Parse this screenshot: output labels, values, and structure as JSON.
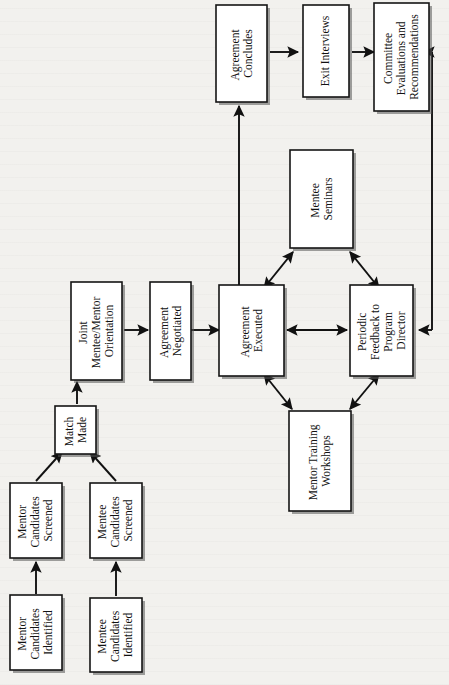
{
  "diagram": {
    "orientation": "rotated-90-ccw",
    "page_background": "#f2f1ee",
    "line_color": "#111111",
    "box_fill": "#ffffff",
    "nodes": [
      {
        "id": "mentor-candidates-identified",
        "lines": [
          "Mentor",
          "Candidates",
          "Identified"
        ]
      },
      {
        "id": "mentee-candidates-identified",
        "lines": [
          "Mentee",
          "Candidates",
          "Identified"
        ]
      },
      {
        "id": "mentor-candidates-screened",
        "lines": [
          "Mentor",
          "Candidates",
          "Screened"
        ]
      },
      {
        "id": "mentee-candidates-screened",
        "lines": [
          "Mentee",
          "Candidates",
          "Screened"
        ]
      },
      {
        "id": "match-made",
        "lines": [
          "Match",
          "Made"
        ]
      },
      {
        "id": "joint-orientation",
        "lines": [
          "Joint",
          "Mentee/Mentor",
          "Orientation"
        ]
      },
      {
        "id": "agreement-negotiated",
        "lines": [
          "Agreement",
          "Negotiated"
        ]
      },
      {
        "id": "agreement-executed",
        "lines": [
          "Agreement",
          "Executed"
        ]
      },
      {
        "id": "periodic-feedback",
        "lines": [
          "Periodic",
          "Feedback to",
          "Program",
          "Director"
        ]
      },
      {
        "id": "mentee-seminars",
        "lines": [
          "Mentee",
          "Seminars"
        ]
      },
      {
        "id": "mentor-training-workshops",
        "lines": [
          "Mentor Training",
          "Workshops"
        ]
      },
      {
        "id": "agreement-concludes",
        "lines": [
          "Agreement",
          "Concludes"
        ]
      },
      {
        "id": "exit-interviews",
        "lines": [
          "Exit Interviews"
        ]
      },
      {
        "id": "committee-evaluations",
        "lines": [
          "Committee",
          "Evaluations and",
          "Recommendations"
        ]
      }
    ],
    "edges": [
      {
        "id": "edge-mentor-identified-to-screened",
        "from": "mentor-candidates-identified",
        "to": "mentor-candidates-screened",
        "style": "single-arrow"
      },
      {
        "id": "edge-mentee-identified-to-screened",
        "from": "mentee-candidates-identified",
        "to": "mentee-candidates-screened",
        "style": "single-arrow"
      },
      {
        "id": "edge-mentor-screened-to-match",
        "from": "mentor-candidates-screened",
        "to": "match-made",
        "style": "single-arrow"
      },
      {
        "id": "edge-mentee-screened-to-match",
        "from": "mentee-candidates-screened",
        "to": "match-made",
        "style": "single-arrow"
      },
      {
        "id": "edge-match-to-orientation",
        "from": "match-made",
        "to": "joint-orientation",
        "style": "single-arrow"
      },
      {
        "id": "edge-orientation-to-negotiated",
        "from": "joint-orientation",
        "to": "agreement-negotiated",
        "style": "single-arrow"
      },
      {
        "id": "edge-negotiated-to-executed",
        "from": "agreement-negotiated",
        "to": "agreement-executed",
        "style": "single-arrow"
      },
      {
        "id": "edge-executed-to-feedback",
        "from": "agreement-executed",
        "to": "periodic-feedback",
        "style": "double-arrow"
      },
      {
        "id": "edge-executed-to-seminars",
        "from": "agreement-executed",
        "to": "mentee-seminars",
        "style": "double-arrow"
      },
      {
        "id": "edge-seminars-to-feedback",
        "from": "mentee-seminars",
        "to": "periodic-feedback",
        "style": "double-arrow"
      },
      {
        "id": "edge-executed-to-workshops",
        "from": "agreement-executed",
        "to": "mentor-training-workshops",
        "style": "double-arrow"
      },
      {
        "id": "edge-workshops-to-feedback",
        "from": "mentor-training-workshops",
        "to": "periodic-feedback",
        "style": "double-arrow"
      },
      {
        "id": "edge-executed-to-concludes",
        "from": "agreement-executed",
        "to": "agreement-concludes",
        "style": "single-arrow"
      },
      {
        "id": "edge-concludes-to-exit",
        "from": "agreement-concludes",
        "to": "exit-interviews",
        "style": "single-arrow"
      },
      {
        "id": "edge-exit-to-committee",
        "from": "exit-interviews",
        "to": "committee-evaluations",
        "style": "single-arrow"
      },
      {
        "id": "edge-committee-to-feedback-loop",
        "from": "committee-evaluations",
        "to": "periodic-feedback",
        "style": "feedback-loop"
      }
    ]
  }
}
